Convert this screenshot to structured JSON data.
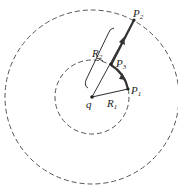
{
  "diagram": {
    "labels": {
      "P1": "P",
      "P1_sub": "1",
      "P2": "P",
      "P2_sub": "2",
      "P3": "P",
      "P3_sub": "3",
      "R1": "R",
      "R1_sub": "1",
      "R2": "R",
      "R2_sub": "2",
      "q": "q"
    },
    "colors": {
      "line": "#333333",
      "dashed": "#555555"
    }
  }
}
